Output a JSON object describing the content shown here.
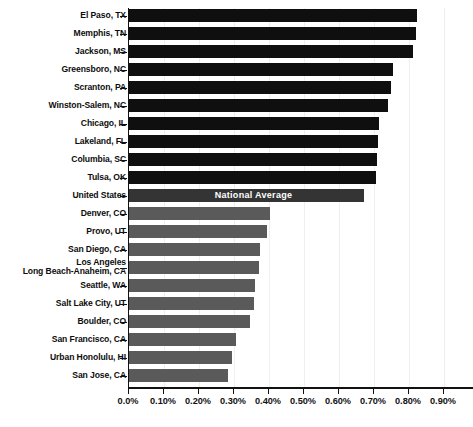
{
  "chart_data": {
    "type": "bar",
    "orientation": "horizontal",
    "title": "",
    "subtitle": "",
    "xlabel": "",
    "ylabel": "",
    "xlim": [
      0.0,
      0.95
    ],
    "xticks": [
      "0.0%",
      "0.10%",
      "0.20%",
      "0.30%",
      "0.40%",
      "0.50%",
      "0.60%",
      "0.70%",
      "0.80%",
      "0.90%"
    ],
    "xtick_values": [
      0.0,
      0.1,
      0.2,
      0.3,
      0.4,
      0.5,
      0.6,
      0.7,
      0.8,
      0.9
    ],
    "grid": "vertical-light",
    "legend": "none",
    "value_unit": "percent",
    "categories": [
      "El Paso, TX",
      "Memphis, TN",
      "Jackson, MS",
      "Greensboro, NC",
      "Scranton, PA",
      "Winston-Salem, NC",
      "Chicago, IL",
      "Lakeland, FL",
      "Columbia, SC",
      "Tulsa, OK",
      "United States",
      "Denver, CO",
      "Provo, UT",
      "San Diego, CA",
      "Los Angeles\nLong Beach-Anaheim, CA",
      "Seattle, WA",
      "Salt Lake City, UT",
      "Boulder, CO",
      "San Francisco, CA",
      "Urban Honolulu, HI",
      "San Jose, CA"
    ],
    "values": [
      0.823,
      0.82,
      0.811,
      0.754,
      0.749,
      0.74,
      0.714,
      0.711,
      0.709,
      0.706,
      0.671,
      0.403,
      0.394,
      0.374,
      0.371,
      0.36,
      0.357,
      0.346,
      0.306,
      0.294,
      0.283
    ],
    "bar_styles": [
      "dark",
      "dark",
      "dark",
      "dark",
      "dark",
      "dark",
      "dark",
      "dark",
      "dark",
      "dark",
      "us",
      "gray",
      "gray",
      "gray",
      "gray",
      "gray",
      "gray",
      "gray",
      "gray",
      "gray",
      "gray"
    ],
    "annotations": [
      {
        "index": 10,
        "text": "National Average",
        "color": "#ffffff"
      }
    ],
    "colors": {
      "high_bar": "#100f0f",
      "national_average_bar": "#343434",
      "low_bar": "#5a5a5a",
      "axis": "#111111",
      "gridline": "#efefef",
      "label_text": "#0d0d0d",
      "annotation_text": "#ffffff",
      "background": "#ffffff"
    }
  }
}
